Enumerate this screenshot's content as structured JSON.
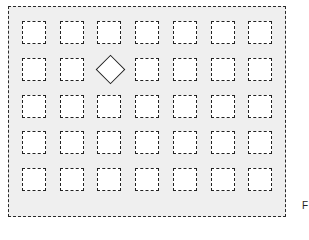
{
  "diagram": {
    "rows": 5,
    "columns": 7,
    "special_cell": {
      "row": 2,
      "column": 3,
      "shape": "diamond"
    },
    "colors": {
      "frame_fill": "#efefef",
      "stroke": "#222222",
      "opening_fill": "#ffffff"
    },
    "corner_label": "F"
  }
}
